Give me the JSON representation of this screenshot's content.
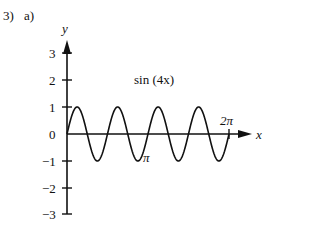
{
  "problem": {
    "number": "3)",
    "part": "a)"
  },
  "chart_data": {
    "type": "line",
    "title": "sin (4x)",
    "function": "y = sin(4x)",
    "xlabel": "x",
    "ylabel": "y",
    "xlim": [
      0,
      6.2832
    ],
    "ylim": [
      -3,
      3
    ],
    "ytick_labels": [
      "3",
      "2",
      "1",
      "0",
      "−1",
      "−2",
      "−3"
    ],
    "yticks": [
      3,
      2,
      1,
      0,
      -1,
      -2,
      -3
    ],
    "x_annotations": [
      {
        "label": "π",
        "x": 3.1416
      },
      {
        "label": "2π",
        "x": 6.2832
      }
    ],
    "grid": false,
    "series": [
      {
        "name": "sin (4x)",
        "amplitude": 1,
        "period": 1.5708
      }
    ]
  },
  "labels": {
    "title": "sin (4x)",
    "x_axis": "x",
    "y_axis": "y",
    "pi": "π",
    "two_pi": "2π",
    "yt3": "3",
    "yt2": "2",
    "yt1": "1",
    "yt0": "0",
    "ytm1": "−1",
    "ytm2": "−2",
    "ytm3": "−3"
  }
}
